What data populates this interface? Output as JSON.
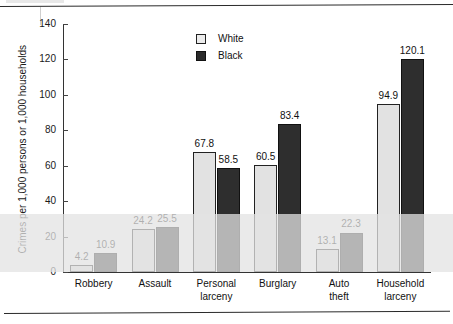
{
  "chart_data": {
    "type": "bar",
    "title": "",
    "xlabel": "",
    "ylabel": "Crimes per 1,000 persons or 1,000 households",
    "ylim": [
      0,
      140
    ],
    "yticks": [
      0,
      20,
      40,
      60,
      80,
      100,
      120,
      140
    ],
    "ytick_labels": [
      "0",
      "20",
      "40",
      "60",
      "80",
      "100",
      "120",
      "140"
    ],
    "grid": false,
    "legend_position": "top-center",
    "categories": [
      "Robbery",
      "Assault",
      "Personal larceny",
      "Burglary",
      "Auto theft",
      "Household larceny"
    ],
    "category_lines": [
      [
        "Robbery"
      ],
      [
        "Assault"
      ],
      [
        "Personal",
        "larceny"
      ],
      [
        "Burglary"
      ],
      [
        "Auto",
        "theft"
      ],
      [
        "Household",
        "larceny"
      ]
    ],
    "series": [
      {
        "name": "White",
        "color": "#e2e2e2",
        "values": [
          4.2,
          24.2,
          67.8,
          60.5,
          13.1,
          94.9
        ],
        "value_labels": [
          "4.2",
          "24.2",
          "67.8",
          "60.5",
          "13.1",
          "94.9"
        ]
      },
      {
        "name": "Black",
        "color": "#2e2e2e",
        "values": [
          10.9,
          25.5,
          58.5,
          83.4,
          22.3,
          120.1
        ],
        "value_labels": [
          "10.9",
          "25.5",
          "58.5",
          "83.4",
          "22.3",
          "120.1"
        ]
      }
    ]
  },
  "legend": {
    "entries": [
      {
        "label": "White",
        "swatch": "white"
      },
      {
        "label": "Black",
        "swatch": "black"
      }
    ]
  },
  "axis": {
    "y_title": "Crimes per 1,000 persons or 1,000 households",
    "tick_labels": [
      "140",
      "120",
      "100",
      "80",
      "60",
      "40",
      "20",
      "0"
    ]
  }
}
